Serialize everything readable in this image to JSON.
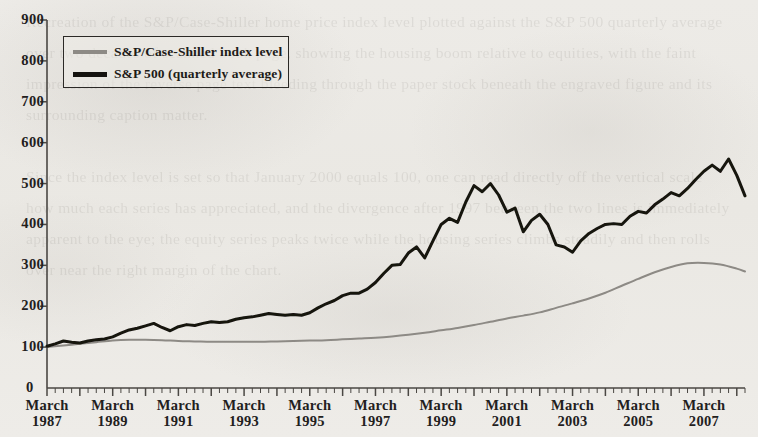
{
  "figure": {
    "background_color": "#eceae6",
    "ink_color": "#1d1b18",
    "bleed_text": "Recreation of the S&P/Case-Shiller home price index level plotted against the S&P 500 quarterly average over two decades of scanned book page, showing the housing boom relative to equities, with the faint impression of the reverse page text bleeding through the paper stock beneath the engraved figure and its surrounding caption matter.\n\nSince the index level is set so that January 2000 equals 100, one can read directly off the vertical scale how much each series has appreciated, and the divergence after 1997 between the two lines is immediately apparent to the eye; the equity series peaks twice while the housing series climbs steadily and then rolls over near the right margin of the chart."
  },
  "legend": {
    "position": "top-left",
    "entries": [
      {
        "label": "S&P/Case-Shiller index level",
        "color": "#8d8a85",
        "swatch": "gray"
      },
      {
        "label": "S&P 500 (quarterly average)",
        "color": "#15130f",
        "swatch": "black"
      }
    ]
  },
  "chart_data": {
    "type": "line",
    "title": "",
    "subtitle": "",
    "xlabel": "",
    "ylabel": "",
    "grid": false,
    "legend_position": "top-left",
    "ylim": [
      0,
      900
    ],
    "yticks": [
      0,
      100,
      200,
      300,
      400,
      500,
      600,
      700,
      800,
      900
    ],
    "ytick_labels": [
      "0",
      "100",
      "200",
      "300",
      "400",
      "500",
      "600",
      "700",
      "800",
      "900"
    ],
    "xtick_labels": [
      "March 1987",
      "March 1989",
      "March 1991",
      "March 1993",
      "March 1995",
      "March 1997",
      "March 1999",
      "March 2001",
      "March 2003",
      "March 2005",
      "March 2007"
    ],
    "xtick_months": [
      "March",
      "March",
      "March",
      "March",
      "March",
      "March",
      "March",
      "March",
      "March",
      "March",
      "March"
    ],
    "xtick_years": [
      "1987",
      "1989",
      "1991",
      "1993",
      "1995",
      "1997",
      "1999",
      "2001",
      "2003",
      "2005",
      "2007"
    ],
    "x_minor_tick_interval": "quarterly",
    "x_start": "1987-Q1",
    "x_end": "2008-Q2",
    "series": [
      {
        "name": "S&P/Case-Shiller index level",
        "color": "#8d8a85",
        "linewidth": 2.0,
        "x": [
          "1987-Q1",
          "1987-Q3",
          "1988-Q1",
          "1988-Q3",
          "1989-Q1",
          "1989-Q3",
          "1990-Q1",
          "1990-Q3",
          "1991-Q1",
          "1991-Q3",
          "1992-Q1",
          "1992-Q3",
          "1993-Q1",
          "1993-Q3",
          "1994-Q1",
          "1994-Q3",
          "1995-Q1",
          "1995-Q3",
          "1996-Q1",
          "1996-Q3",
          "1997-Q1",
          "1997-Q3",
          "1998-Q1",
          "1998-Q3",
          "1999-Q1",
          "1999-Q3",
          "2000-Q1",
          "2000-Q3",
          "2001-Q1",
          "2001-Q3",
          "2002-Q1",
          "2002-Q3",
          "2003-Q1",
          "2003-Q3",
          "2004-Q1",
          "2004-Q3",
          "2005-Q1",
          "2005-Q3",
          "2006-Q1",
          "2006-Q3",
          "2007-Q1",
          "2007-Q3",
          "2008-Q1",
          "2008-Q2"
        ],
        "values": [
          100,
          104,
          108,
          112,
          116,
          118,
          118,
          117,
          115,
          114,
          113,
          113,
          113,
          113,
          114,
          115,
          116,
          117,
          119,
          121,
          123,
          126,
          130,
          135,
          141,
          147,
          154,
          162,
          170,
          177,
          185,
          196,
          207,
          219,
          233,
          250,
          267,
          283,
          296,
          305,
          306,
          302,
          292,
          285
        ]
      },
      {
        "name": "S&P 500 (quarterly average)",
        "color": "#15130f",
        "linewidth": 3.0,
        "x": [
          "1987-Q1",
          "1987-Q2",
          "1987-Q3",
          "1987-Q4",
          "1988-Q1",
          "1988-Q2",
          "1988-Q3",
          "1988-Q4",
          "1989-Q1",
          "1989-Q2",
          "1989-Q3",
          "1989-Q4",
          "1990-Q1",
          "1990-Q2",
          "1990-Q3",
          "1990-Q4",
          "1991-Q1",
          "1991-Q2",
          "1991-Q3",
          "1991-Q4",
          "1992-Q1",
          "1992-Q2",
          "1992-Q3",
          "1992-Q4",
          "1993-Q1",
          "1993-Q2",
          "1993-Q3",
          "1993-Q4",
          "1994-Q1",
          "1994-Q2",
          "1994-Q3",
          "1994-Q4",
          "1995-Q1",
          "1995-Q2",
          "1995-Q3",
          "1995-Q4",
          "1996-Q1",
          "1996-Q2",
          "1996-Q3",
          "1996-Q4",
          "1997-Q1",
          "1997-Q2",
          "1997-Q3",
          "1997-Q4",
          "1998-Q1",
          "1998-Q2",
          "1998-Q3",
          "1998-Q4",
          "1999-Q1",
          "1999-Q2",
          "1999-Q3",
          "1999-Q4",
          "2000-Q1",
          "2000-Q2",
          "2000-Q3",
          "2000-Q4",
          "2001-Q1",
          "2001-Q2",
          "2001-Q3",
          "2001-Q4",
          "2002-Q1",
          "2002-Q2",
          "2002-Q3",
          "2002-Q4",
          "2003-Q1",
          "2003-Q2",
          "2003-Q3",
          "2003-Q4",
          "2004-Q1",
          "2004-Q2",
          "2004-Q3",
          "2004-Q4",
          "2005-Q1",
          "2005-Q2",
          "2005-Q3",
          "2005-Q4",
          "2006-Q1",
          "2006-Q2",
          "2006-Q3",
          "2006-Q4",
          "2007-Q1",
          "2007-Q2",
          "2007-Q3",
          "2007-Q4",
          "2008-Q1",
          "2008-Q2"
        ],
        "values": [
          102,
          108,
          115,
          112,
          110,
          115,
          118,
          120,
          125,
          134,
          142,
          146,
          152,
          158,
          148,
          140,
          150,
          155,
          153,
          158,
          162,
          160,
          162,
          168,
          172,
          174,
          178,
          182,
          180,
          178,
          180,
          178,
          184,
          196,
          206,
          214,
          226,
          232,
          232,
          242,
          258,
          280,
          300,
          302,
          330,
          345,
          318,
          360,
          400,
          415,
          405,
          455,
          495,
          480,
          500,
          472,
          430,
          440,
          382,
          410,
          425,
          400,
          350,
          345,
          332,
          360,
          378,
          390,
          400,
          402,
          400,
          420,
          432,
          428,
          448,
          462,
          478,
          470,
          488,
          510,
          530,
          545,
          530,
          560,
          520,
          470
        ],
        "peak_2000": 500,
        "trough_2002": 345,
        "peak_2007": 560
      }
    ]
  },
  "axes": {
    "y_axis_line_color": "#4a4743",
    "x_axis_line_color": "#4a4743",
    "origin_label": "0"
  }
}
